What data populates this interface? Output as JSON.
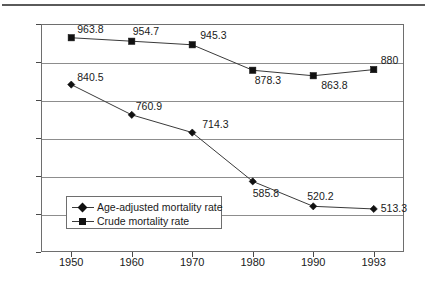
{
  "chart_data": {
    "type": "line",
    "title": "",
    "xlabel": "",
    "ylabel": "Deaths per 100,000 population",
    "categories": [
      "1950",
      "1960",
      "1970",
      "1980",
      "1990",
      "1993"
    ],
    "ylim": [
      400,
      1000
    ],
    "yticks": [
      "400",
      "500",
      "600",
      "700",
      "800",
      "900",
      "1000"
    ],
    "grid": true,
    "legend_position": "inside-lower-left",
    "series": [
      {
        "name": "Age-adjusted mortality rate",
        "marker": "diamond",
        "values": [
          840.5,
          760.9,
          714.3,
          585.8,
          520.2,
          513.3
        ],
        "labels": [
          "840.5",
          "760.9",
          "714.3",
          "585.8",
          "520.2",
          "513.3"
        ]
      },
      {
        "name": "Crude mortality rate",
        "marker": "square",
        "values": [
          963.8,
          954.7,
          945.3,
          878.3,
          863.8,
          880
        ],
        "labels": [
          "963.8",
          "954.7",
          "945.3",
          "878.3",
          "863.8",
          "880"
        ]
      }
    ]
  },
  "colors": {
    "series_line": "#3a3a3a",
    "marker": "#111111",
    "gridline": "#8d8d8d",
    "frame": "#6e6e6e",
    "top_rule": "#5a5a5a",
    "background": "#ffffff"
  }
}
